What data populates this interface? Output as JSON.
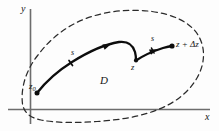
{
  "figure": {
    "kind": "complex-analysis-contour-diagram",
    "axes": {
      "x_label": "x",
      "y_label": "y"
    },
    "region": {
      "label": "D",
      "boundary_style": "dashed"
    },
    "points": [
      {
        "name": "start-point",
        "label": "z",
        "subscript": "0",
        "x": 37,
        "y": 93
      },
      {
        "name": "mid-point",
        "label": "z",
        "x": 136,
        "y": 60
      },
      {
        "name": "end-point",
        "label": "z + Δz",
        "x": 172,
        "y": 46
      }
    ],
    "path_labels": [
      {
        "name": "arc-label-first",
        "label": "s",
        "x": 71,
        "y": 49
      },
      {
        "name": "arc-label-second",
        "label": "s",
        "x": 151,
        "y": 35
      }
    ],
    "colors": {
      "background": "#fdfdfd",
      "ink": "#151515",
      "axis": "#6d6d6d",
      "boundary": "#2b2b2b",
      "contour": "#0d0d0d"
    }
  }
}
